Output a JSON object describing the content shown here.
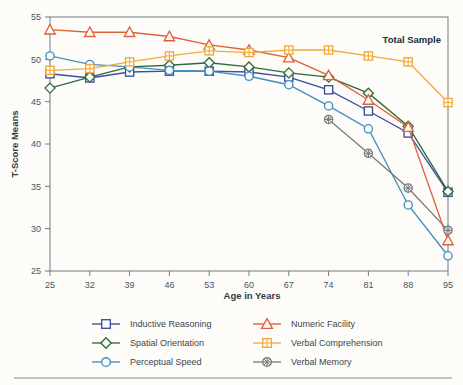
{
  "figure": {
    "panel_title": "Total Sample",
    "background_color": "#fdfcf8"
  },
  "chart_data": {
    "type": "line",
    "title": "Total Sample",
    "xlabel": "Age in Years",
    "ylabel": "T-Score Means",
    "x": [
      25,
      32,
      39,
      46,
      53,
      60,
      67,
      74,
      81,
      88,
      95
    ],
    "categories": [
      "25",
      "32",
      "39",
      "46",
      "53",
      "60",
      "67",
      "74",
      "81",
      "88",
      "95"
    ],
    "xlim": [
      25,
      95
    ],
    "ylim": [
      25,
      55
    ],
    "yticks": [
      25,
      30,
      35,
      40,
      45,
      50,
      55
    ],
    "xticks": [
      25,
      32,
      39,
      46,
      53,
      60,
      67,
      74,
      81,
      88,
      95
    ],
    "grid": false,
    "legend_position": "below-axes",
    "series": [
      {
        "name": "Inductive Reasoning",
        "color": "#3b4f9e",
        "marker": "square",
        "values": [
          48.3,
          47.8,
          48.5,
          48.6,
          48.6,
          48.5,
          47.9,
          46.4,
          43.9,
          41.3,
          34.3
        ]
      },
      {
        "name": "Spatial Orientation",
        "color": "#2f6b3c",
        "marker": "diamond",
        "values": [
          46.6,
          47.9,
          49.1,
          49.3,
          49.6,
          49.1,
          48.4,
          47.9,
          46.0,
          42.1,
          34.4
        ]
      },
      {
        "name": "Perceptual Speed",
        "color": "#3f8fc4",
        "marker": "circle",
        "values": [
          50.4,
          49.4,
          49.1,
          48.7,
          48.6,
          48.0,
          47.0,
          44.5,
          41.8,
          32.8,
          26.8
        ]
      },
      {
        "name": "Numeric Facility",
        "color": "#e0603a",
        "marker": "triangle",
        "values": [
          53.5,
          53.2,
          53.2,
          52.7,
          51.7,
          51.1,
          50.2,
          48.1,
          45.2,
          42.0,
          28.6
        ]
      },
      {
        "name": "Verbal Comprehension",
        "color": "#f0ab3d",
        "marker": "square-cross",
        "values": [
          48.7,
          48.9,
          49.7,
          50.4,
          51.0,
          50.8,
          51.1,
          51.1,
          50.4,
          49.7,
          44.9
        ]
      },
      {
        "name": "Verbal Memory",
        "color": "#7b7b7b",
        "marker": "circle-cross",
        "values": [
          null,
          null,
          null,
          null,
          null,
          null,
          null,
          42.9,
          38.9,
          34.8,
          29.8
        ]
      }
    ]
  },
  "legend": {
    "items": [
      {
        "label": "Inductive Reasoning",
        "color": "#3b4f9e",
        "marker": "square"
      },
      {
        "label": "Spatial Orientation",
        "color": "#2f6b3c",
        "marker": "diamond"
      },
      {
        "label": "Perceptual Speed",
        "color": "#3f8fc4",
        "marker": "circle"
      },
      {
        "label": "Numeric Facility",
        "color": "#e0603a",
        "marker": "triangle"
      },
      {
        "label": "Verbal Comprehension",
        "color": "#f0ab3d",
        "marker": "square-cross"
      },
      {
        "label": "Verbal Memory",
        "color": "#7b7b7b",
        "marker": "circle-cross"
      }
    ]
  },
  "axes": {
    "y_label": "T-Score Means",
    "x_label": "Age in Years",
    "y_tick_labels": [
      "25",
      "30",
      "35",
      "40",
      "45",
      "50",
      "55"
    ],
    "x_tick_labels": [
      "25",
      "32",
      "39",
      "46",
      "53",
      "60",
      "67",
      "74",
      "81",
      "88",
      "95"
    ]
  }
}
